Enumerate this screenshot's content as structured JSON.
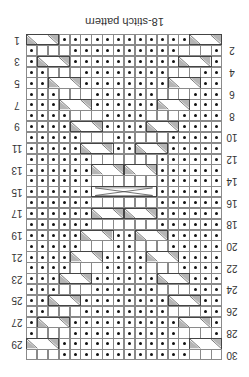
{
  "title": "18-stitch pattern",
  "orientation": "rotated 180 degrees",
  "grid": {
    "columns": 18,
    "rows": 30
  },
  "colors": {
    "grid_line": "#8a8a8a",
    "cable_shade": "#b5b5b5",
    "dot": "#111111",
    "text": "#333333"
  },
  "row_labels_left": [
    "1",
    "3",
    "5",
    "7",
    "9",
    "11",
    "13",
    "15",
    "17",
    "19",
    "21",
    "23",
    "25",
    "27",
    "29"
  ],
  "row_labels_right": [
    "2",
    "4",
    "6",
    "8",
    "10",
    "12",
    "14",
    "16",
    "18",
    "20",
    "22",
    "24",
    "26",
    "28",
    "30"
  ],
  "legend_symbols": {
    "dot": "purl stitch",
    "blank": "knit stitch",
    "cable": "cable cross"
  }
}
